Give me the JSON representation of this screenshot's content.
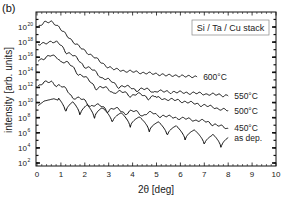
{
  "chart_data": {
    "type": "line",
    "panel_label": "(b)",
    "title": "",
    "xlabel": "2θ  [deg]",
    "ylabel": "intensity [arb. units]",
    "yscale": "log",
    "xlim": [
      0,
      10
    ],
    "ylim_exp": [
      2,
      22
    ],
    "x_ticks": [
      "0",
      "1",
      "2",
      "3",
      "4",
      "5",
      "6",
      "7",
      "8",
      "9",
      "10"
    ],
    "y_ticks": [
      {
        "base": "10",
        "exp": "2"
      },
      {
        "base": "10",
        "exp": "4"
      },
      {
        "base": "10",
        "exp": "6"
      },
      {
        "base": "10",
        "exp": "8"
      },
      {
        "base": "10",
        "exp": "10"
      },
      {
        "base": "10",
        "exp": "12"
      },
      {
        "base": "10",
        "exp": "14"
      },
      {
        "base": "10",
        "exp": "16"
      },
      {
        "base": "10",
        "exp": "18"
      },
      {
        "base": "10",
        "exp": "20"
      }
    ],
    "legend": {
      "text": "Si / Ta / Cu stack",
      "position": "top-right"
    },
    "grid": false,
    "series": [
      {
        "name": "600°C",
        "x": [
          0.05,
          0.3,
          0.6,
          0.8,
          1.2,
          1.6,
          2.0,
          2.4,
          2.8,
          3.2,
          3.6,
          4.5,
          5.5,
          6.7
        ],
        "log_values": [
          20.0,
          20.6,
          20.7,
          20.3,
          19.0,
          17.8,
          16.8,
          16.0,
          15.0,
          14.4,
          14.2,
          13.9,
          13.6,
          13.4
        ],
        "oscillation": 0.15
      },
      {
        "name": "550°C",
        "x": [
          0.05,
          0.3,
          0.6,
          0.9,
          1.3,
          1.7,
          2.1,
          2.5,
          2.9,
          3.3,
          3.8,
          4.5,
          5.5,
          6.7,
          8.0
        ],
        "log_values": [
          17.6,
          17.8,
          18.1,
          17.7,
          16.6,
          15.6,
          14.6,
          13.8,
          13.0,
          12.3,
          11.9,
          11.6,
          11.4,
          11.2,
          10.9
        ],
        "oscillation": 0.5
      },
      {
        "name": "500°C",
        "x": [
          0.05,
          0.3,
          0.6,
          0.9,
          1.3,
          1.7,
          2.1,
          2.5,
          3.0,
          3.5,
          4.0,
          5.0,
          6.0,
          7.0,
          8.0
        ],
        "log_values": [
          15.5,
          15.9,
          16.2,
          15.8,
          15.0,
          14.0,
          12.9,
          12.0,
          11.6,
          11.2,
          11.0,
          10.6,
          10.2,
          9.6,
          8.9
        ],
        "oscillation": 0.6
      },
      {
        "name": "450°C",
        "x": [
          0.05,
          0.3,
          0.6,
          0.9,
          1.3,
          1.7,
          2.1,
          2.5,
          3.0,
          3.5,
          4.0,
          5.0,
          6.0,
          7.0,
          8.0
        ],
        "log_values": [
          12.2,
          12.6,
          12.7,
          12.2,
          11.3,
          10.4,
          9.9,
          9.4,
          9.1,
          8.8,
          8.6,
          8.3,
          7.9,
          7.5,
          6.5
        ],
        "oscillation": 0.7
      },
      {
        "name": "as dep.",
        "x": [
          0.05,
          0.3,
          0.7,
          1.2,
          1.8,
          2.4,
          3.2,
          4.0,
          4.8,
          5.6,
          6.4,
          7.2,
          8.0
        ],
        "log_values": [
          9.6,
          10.2,
          10.5,
          10.0,
          9.6,
          9.2,
          8.6,
          8.0,
          7.4,
          6.8,
          6.2,
          5.6,
          5.2
        ],
        "fringe_minima_x": [
          1.2,
          1.8,
          2.4,
          3.15,
          3.9,
          4.7,
          5.45,
          6.2,
          7.0,
          7.7
        ],
        "fringe_depth": 1.8
      }
    ]
  }
}
